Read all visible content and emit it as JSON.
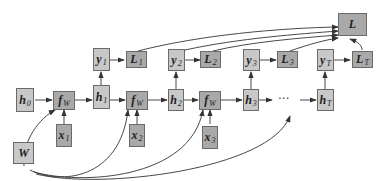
{
  "diagram": {
    "colors": {
      "light_node": "#c8c8c8",
      "dark_node": "#a9a9a9",
      "edge": "#333333",
      "border": "#6a6a6a"
    },
    "nodes": {
      "h0": {
        "base": "h",
        "sub": "0"
      },
      "fw1": {
        "base": "f",
        "sub": "W"
      },
      "x1": {
        "base": "x",
        "sub": "1"
      },
      "h1": {
        "base": "h",
        "sub": "1"
      },
      "y1": {
        "base": "y",
        "sub": "1"
      },
      "L1": {
        "base": "L",
        "sub": "1"
      },
      "fw2": {
        "base": "f",
        "sub": "W"
      },
      "x2": {
        "base": "x",
        "sub": "2"
      },
      "h2": {
        "base": "h",
        "sub": "2"
      },
      "y2": {
        "base": "y",
        "sub": "2"
      },
      "L2": {
        "base": "L",
        "sub": "2"
      },
      "fw3": {
        "base": "f",
        "sub": "W"
      },
      "x3": {
        "base": "x",
        "sub": "3"
      },
      "h3": {
        "base": "h",
        "sub": "3"
      },
      "y3": {
        "base": "y",
        "sub": "3"
      },
      "L3": {
        "base": "L",
        "sub": "3"
      },
      "hT": {
        "base": "h",
        "sub": "T"
      },
      "yT": {
        "base": "y",
        "sub": "T"
      },
      "LT": {
        "base": "L",
        "sub": "T"
      },
      "L": {
        "base": "L",
        "sub": ""
      },
      "W": {
        "base": "W",
        "sub": ""
      }
    },
    "ellipsis": "···"
  }
}
